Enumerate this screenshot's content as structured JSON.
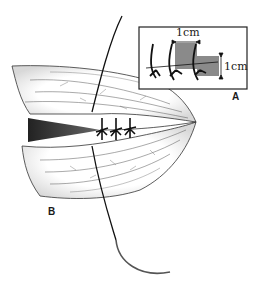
{
  "figure": {
    "labels": {
      "panel_a": "A",
      "panel_b": "B"
    },
    "inset": {
      "measure_horizontal": "1cm",
      "measure_vertical": "1cm"
    },
    "colors": {
      "line": "#1a1a1a",
      "shade": "#888888",
      "background": "#ffffff"
    }
  }
}
